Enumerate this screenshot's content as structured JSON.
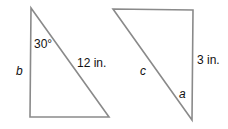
{
  "diagram": {
    "stroke_color": "#8a8a8a",
    "triangles": [
      {
        "id": "left",
        "angle_label": "30°",
        "side_label_left": "b",
        "hypotenuse_label": "12 in."
      },
      {
        "id": "right",
        "hypotenuse_label": "c",
        "side_label_right": "3 in.",
        "angle_label": "a"
      }
    ]
  }
}
